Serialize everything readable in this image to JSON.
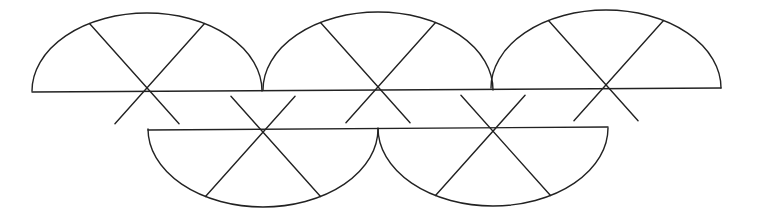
{
  "diagram": {
    "width": 763,
    "height": 223,
    "stroke_color": "#222222",
    "background": "#ffffff",
    "rx": 115,
    "ry": 78,
    "spoke_extension": 43,
    "top_row": [
      {
        "cx": 147,
        "cy": 91
      },
      {
        "cx": 378,
        "cy": 90
      },
      {
        "cx": 606,
        "cy": 88
      }
    ],
    "bottom_row": [
      {
        "cx": 263,
        "cy": 129
      },
      {
        "cx": 493,
        "cy": 128
      }
    ]
  }
}
